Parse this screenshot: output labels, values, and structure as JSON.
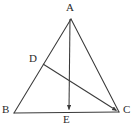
{
  "figure": {
    "type": "geometry-diagram",
    "background_color": "#ffffff",
    "stroke_color": "#3a3a3a",
    "label_color": "#2b2b2b",
    "stroke_width": 1,
    "points": {
      "A": {
        "label": "A",
        "x": 71,
        "y": 19
      },
      "B": {
        "label": "B",
        "x": 14,
        "y": 113
      },
      "C": {
        "label": "C",
        "x": 119,
        "y": 112
      },
      "D": {
        "label": "D",
        "x": 43,
        "y": 64
      },
      "E": {
        "label": "E",
        "x": 68,
        "y": 112
      }
    },
    "segments": [
      {
        "name": "AB",
        "from": "A",
        "to": "B",
        "arrow": "none"
      },
      {
        "name": "AC",
        "from": "A",
        "to": "C",
        "arrow": "none"
      },
      {
        "name": "BC",
        "from": "B",
        "to": "C",
        "arrow": "none"
      },
      {
        "name": "AE",
        "from": "A",
        "to": "E",
        "arrow": "end"
      },
      {
        "name": "DC",
        "from": "D",
        "to": "C",
        "arrow": "end"
      }
    ]
  }
}
